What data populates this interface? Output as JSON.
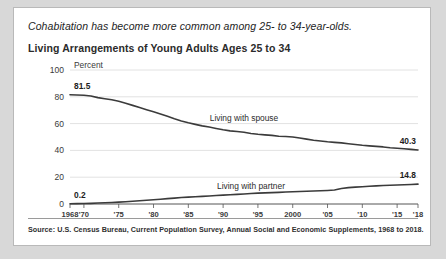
{
  "card": {
    "headline": "Cohabitation has become more common among 25- to 34-year-olds.",
    "subtitle": "Living Arrangements of Young Adults Ages 25 to 34",
    "source": "Source: U.S. Census Bureau, Current Population Survey, Annual Social and Economic Supplements, 1968 to 2018."
  },
  "chart_data": {
    "type": "line",
    "title": "Living Arrangements of Young Adults Ages 25 to 34",
    "subtitle": "Cohabitation has become more common among 25- to 34-year-olds.",
    "xlabel": "",
    "ylabel": "Percent",
    "ylim": [
      0,
      100
    ],
    "xlim": [
      1968,
      2018
    ],
    "yticks": [
      0,
      20,
      40,
      60,
      80,
      100
    ],
    "ytick_labels": [
      "0",
      "20",
      "40",
      "60",
      "80",
      "100"
    ],
    "xticks": [
      1968,
      1970,
      1975,
      1980,
      1985,
      1990,
      1995,
      2000,
      2005,
      2010,
      2015,
      2018
    ],
    "xtick_labels": [
      "1968",
      "'70",
      "'75",
      "'80",
      "'85",
      "'90",
      "'95",
      "2000",
      "'05",
      "'10",
      "'15",
      "'18"
    ],
    "grid": true,
    "grid_axis": "y",
    "legend": "inline-labels",
    "line_color": "#3b3b3b",
    "annotations": [
      {
        "text": "81.5",
        "series": "Living with spouse",
        "x": 1968,
        "y": 81.5,
        "position": "above-left"
      },
      {
        "text": "40.3",
        "series": "Living with spouse",
        "x": 2018,
        "y": 40.3,
        "position": "above-right"
      },
      {
        "text": "0.2",
        "series": "Living with partner",
        "x": 1968,
        "y": 0.2,
        "position": "above-left"
      },
      {
        "text": "14.8",
        "series": "Living with partner",
        "x": 2018,
        "y": 14.8,
        "position": "above-right"
      }
    ],
    "x": [
      1968,
      1969,
      1970,
      1971,
      1972,
      1973,
      1974,
      1975,
      1976,
      1977,
      1978,
      1979,
      1980,
      1981,
      1982,
      1983,
      1984,
      1985,
      1986,
      1987,
      1988,
      1989,
      1990,
      1991,
      1992,
      1993,
      1994,
      1995,
      1996,
      1997,
      1998,
      1999,
      2000,
      2001,
      2002,
      2003,
      2004,
      2005,
      2006,
      2007,
      2008,
      2009,
      2010,
      2011,
      2012,
      2013,
      2014,
      2015,
      2016,
      2017,
      2018
    ],
    "series": [
      {
        "name": "Living with spouse",
        "label": "Living with spouse",
        "start_value": 81.5,
        "end_value": 40.3,
        "values": [
          81.5,
          81.3,
          81.2,
          80.6,
          79.4,
          78.6,
          77.8,
          76.7,
          75.2,
          73.6,
          72.0,
          70.4,
          68.8,
          67.2,
          65.4,
          63.6,
          62.0,
          60.6,
          59.4,
          58.3,
          57.4,
          56.4,
          55.4,
          54.6,
          54.1,
          53.6,
          52.6,
          52.0,
          51.6,
          51.2,
          50.6,
          50.4,
          50.0,
          49.2,
          48.4,
          47.6,
          47.0,
          46.4,
          46.0,
          45.6,
          45.0,
          44.4,
          43.8,
          43.4,
          43.0,
          42.6,
          42.0,
          41.6,
          41.2,
          40.8,
          40.3
        ]
      },
      {
        "name": "Living with partner",
        "label": "Living with partner",
        "start_value": 0.2,
        "end_value": 14.8,
        "values": [
          0.2,
          0.3,
          0.4,
          0.5,
          0.7,
          0.9,
          1.1,
          1.4,
          1.7,
          2.0,
          2.4,
          2.8,
          3.2,
          3.6,
          4.0,
          4.4,
          4.8,
          5.1,
          5.4,
          5.7,
          6.0,
          6.3,
          6.6,
          6.9,
          7.2,
          7.5,
          7.8,
          8.1,
          8.3,
          8.5,
          8.7,
          8.9,
          9.1,
          9.3,
          9.5,
          9.7,
          9.9,
          10.1,
          10.4,
          11.6,
          12.2,
          12.6,
          12.9,
          13.2,
          13.5,
          13.8,
          14.0,
          14.2,
          14.4,
          14.6,
          14.8
        ]
      }
    ]
  }
}
